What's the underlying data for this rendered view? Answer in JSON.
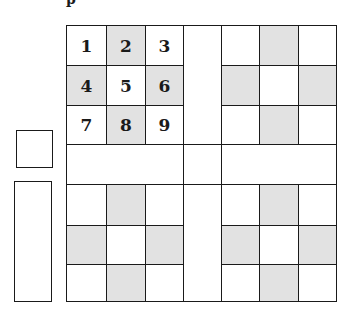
{
  "diagram": {
    "top_text_fragment": "p",
    "shade_color": "#e2e2e2",
    "line_color": "#1a1a1a",
    "grid": {
      "columns": 7,
      "rows": 7,
      "numbered_block": {
        "labels": [
          "1",
          "2",
          "3",
          "4",
          "5",
          "6",
          "7",
          "8",
          "9"
        ],
        "shaded": [
          false,
          true,
          false,
          true,
          false,
          true,
          false,
          true,
          false
        ]
      },
      "blocks": [
        {
          "position": "top-left",
          "numbered": true,
          "pattern": "cross-shaded"
        },
        {
          "position": "top-right",
          "numbered": false,
          "pattern": "cross-shaded"
        },
        {
          "position": "bottom-left",
          "numbered": false,
          "pattern": "cross-shaded"
        },
        {
          "position": "bottom-right",
          "numbered": false,
          "pattern": "cross-shaded"
        }
      ],
      "bands": {
        "row": 4,
        "column": 4
      }
    },
    "side_boxes": [
      {
        "name": "small-square",
        "shape": "square"
      },
      {
        "name": "tall-rectangle",
        "shape": "rectangle"
      }
    ]
  }
}
